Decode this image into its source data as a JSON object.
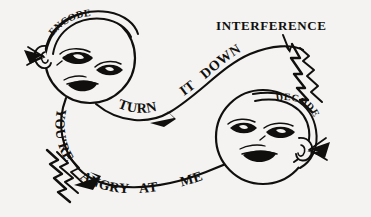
{
  "figure": {
    "background_color": "#f4f3f1",
    "ink_color": "#100f0d",
    "width": 371,
    "height": 217
  },
  "annotations": {
    "interference_label": "INTERFERENCE"
  },
  "faces": [
    {
      "id": "encoder",
      "band_label": "ENCODE",
      "position": "upper-left",
      "features": [
        "left-ear",
        "two-eyes",
        "mouth",
        "headband"
      ]
    },
    {
      "id": "decoder",
      "band_label": "DECODE",
      "position": "lower-right",
      "features": [
        "right-ear",
        "two-eyes",
        "mouth",
        "headband"
      ]
    }
  ],
  "messages": [
    {
      "id": "outgoing",
      "direction": "encoder-to-decoder",
      "words": [
        "TURN",
        "IT",
        "DOWN"
      ],
      "full_text": "TURN IT DOWN",
      "has_interference": true
    },
    {
      "id": "incoming",
      "direction": "decoder-to-encoder",
      "words": [
        "YOU'RE",
        "ANGRY",
        "AT",
        "ME"
      ],
      "full_text": "YOU'RE ANGRY AT ME",
      "has_interference": true
    }
  ],
  "word_placements": {
    "turn": "TURN",
    "it": "IT",
    "down": "DOWN",
    "youre": "YOU'RE",
    "angry": "ANGRY",
    "at": "AT",
    "me": "ME"
  }
}
